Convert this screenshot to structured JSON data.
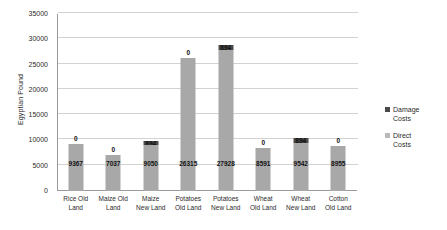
{
  "chart_data": {
    "type": "bar",
    "subtype": "stacked-column",
    "title": "",
    "xlabel": "",
    "ylabel": "Egyptian Pound",
    "ylim": [
      0,
      35000
    ],
    "ytick_step": 5000,
    "yticks": [
      "0",
      "5000",
      "10000",
      "15000",
      "20000",
      "25000",
      "30000",
      "35000"
    ],
    "grid": true,
    "legend_position": "right",
    "categories": [
      "Rice Old Land",
      "Maize Old Land",
      "Maize New Land",
      "Potatoes Old Land",
      "Potatoes New Land",
      "Wheat Old Land",
      "Wheat New Land",
      "Cotton Old Land"
    ],
    "series": [
      {
        "name": "Direct Costs",
        "color": "#a8a8a8",
        "values": [
          9367,
          7037,
          9050,
          26315,
          27928,
          8591,
          9542,
          8955
        ],
        "labels": [
          "9367",
          "7037",
          "9050",
          "26315",
          "27928",
          "8591",
          "9542",
          "8955"
        ]
      },
      {
        "name": "Damage Costs",
        "color": "#4a4a4a",
        "values": [
          0,
          0,
          894,
          0,
          894,
          0,
          894,
          0
        ],
        "labels": [
          "0",
          "0",
          "894",
          "0",
          "894",
          "0",
          "894",
          "0"
        ]
      }
    ]
  },
  "legend": {
    "items": [
      {
        "label_line1": "Damage",
        "label_line2": "Costs",
        "color": "#4a4a4a"
      },
      {
        "label_line1": "Direct",
        "label_line2": "Costs",
        "color": "#b9b9b9"
      }
    ]
  }
}
